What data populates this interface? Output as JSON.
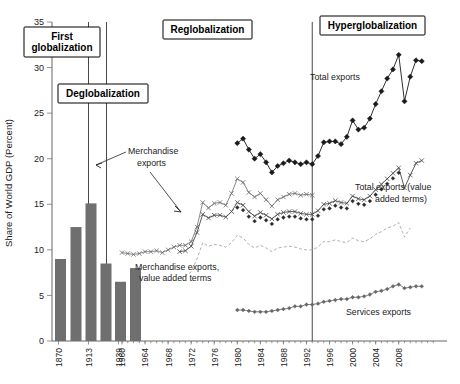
{
  "figure": {
    "y_axis_title": "Share of World GDP (Percent)",
    "y_ticks": [
      0,
      5,
      10,
      15,
      20,
      25,
      30,
      35
    ],
    "y_min": 0,
    "y_max": 35,
    "x_ticks_early": [
      "1870",
      "1913",
      "1939",
      "1960"
    ],
    "x_ticks_modern": [
      "1964",
      "1968",
      "1972",
      "1976",
      "1980",
      "1984",
      "1988",
      "1992",
      "1996",
      "2000",
      "2004",
      "2008"
    ]
  },
  "eras": [
    {
      "label": "First\nglobalization",
      "line1": "First",
      "line2": "globalization"
    },
    {
      "label": "Deglobalization"
    },
    {
      "label": "Reglobalization"
    },
    {
      "label": "Hyperglobalization"
    }
  ],
  "era_labels": {
    "first_line1": "First",
    "first_line2": "globalization",
    "deglobalization": "Deglobalization",
    "reglobalization": "Reglobalization",
    "hyperglobalization": "Hyperglobalization"
  },
  "annotations": {
    "merchandise_exports_line1": "Merchandise",
    "merchandise_exports_line2": "exports",
    "merchandise_va_line1": "Merchandise exports,",
    "merchandise_va_line2": "value added terms",
    "total_exports": "Total exports",
    "total_exports_va_line1": "Total exports (value",
    "total_exports_va_line2": "added terms)",
    "services_exports": "Services exports"
  },
  "colors": {
    "bar": "#6f6f6f",
    "total_exports": "#1a1a1a",
    "total_exports_va": "#4a4a4a",
    "merchandise": "#6a6a6a",
    "merchandise_va": "#b0b0b0",
    "services": "#666666",
    "divider": "#333333",
    "axis": "#555555"
  },
  "chart_data": {
    "type": "line",
    "title": "",
    "xlabel": "",
    "ylabel": "Share of World GDP (Percent)",
    "ylim": [
      0,
      35
    ],
    "grid": false,
    "legend": "annotations-inline",
    "era_dividers_years": [
      1913,
      1939,
      1993
    ],
    "bars": {
      "type": "bar",
      "name": "Merchandise exports (historical benchmarks)",
      "categories": [
        "1870",
        "1890",
        "1913",
        "1929",
        "1939",
        "1950"
      ],
      "values": [
        9.0,
        12.5,
        15.1,
        8.5,
        6.5,
        8.0
      ]
    },
    "series": [
      {
        "name": "Merchandise exports",
        "marker": "x",
        "x": [
          1960,
          1961,
          1962,
          1963,
          1964,
          1965,
          1966,
          1967,
          1968,
          1969,
          1970,
          1971,
          1972,
          1973,
          1974,
          1975,
          1976,
          1977,
          1978,
          1979,
          1980,
          1981,
          1982,
          1983,
          1984,
          1985,
          1986,
          1987,
          1988,
          1989,
          1990,
          1991,
          1992,
          1993
        ],
        "values": [
          9.7,
          9.6,
          9.5,
          9.6,
          9.8,
          9.8,
          9.9,
          9.7,
          10.0,
          10.3,
          10.5,
          10.5,
          10.9,
          12.5,
          15.2,
          14.6,
          15.1,
          15.2,
          14.9,
          16.2,
          17.8,
          17.4,
          16.3,
          15.8,
          16.2,
          15.5,
          14.8,
          15.5,
          15.8,
          16.1,
          16.2,
          16.0,
          16.1,
          16.0
        ]
      },
      {
        "name": "Merchandise exports, value added terms",
        "marker": "dashed",
        "x": [
          1970,
          1971,
          1972,
          1973,
          1974,
          1975,
          1976,
          1977,
          1978,
          1979,
          1980,
          1981,
          1982,
          1983,
          1984,
          1985,
          1986,
          1987,
          1988,
          1989,
          1990,
          1991,
          1992,
          1993,
          1994,
          1995,
          1996,
          1997,
          1998,
          1999,
          2000,
          2001,
          2002,
          2003,
          2004,
          2005,
          2006,
          2007,
          2008,
          2009,
          2010
        ],
        "values": [
          7.0,
          7.1,
          7.6,
          9.0,
          10.8,
          10.4,
          10.6,
          10.5,
          10.3,
          10.8,
          11.6,
          11.3,
          10.6,
          10.2,
          10.5,
          10.2,
          9.8,
          10.2,
          10.3,
          10.4,
          10.3,
          10.1,
          10.0,
          10.0,
          10.3,
          10.9,
          10.9,
          11.1,
          10.9,
          10.8,
          11.3,
          11.0,
          10.9,
          11.2,
          11.7,
          12.0,
          12.4,
          12.6,
          13.0,
          11.4,
          12.4
        ]
      },
      {
        "name": "Total exports",
        "marker": "filled-diamond",
        "x": [
          1980,
          1981,
          1982,
          1983,
          1984,
          1985,
          1986,
          1987,
          1988,
          1989,
          1990,
          1991,
          1992,
          1993,
          1994,
          1995,
          1996,
          1997,
          1998,
          1999,
          2000,
          2001,
          2002,
          2003,
          2004,
          2005,
          2006,
          2007,
          2008,
          2009,
          2010,
          2011,
          2012
        ],
        "values": [
          21.7,
          22.2,
          21.0,
          20.0,
          20.5,
          19.6,
          18.5,
          19.2,
          19.5,
          19.8,
          19.6,
          19.4,
          19.6,
          19.4,
          20.3,
          21.8,
          21.9,
          21.9,
          21.6,
          22.4,
          24.2,
          23.2,
          23.4,
          24.4,
          26.0,
          27.4,
          28.8,
          29.8,
          31.4,
          26.3,
          29.0,
          30.8,
          30.7
        ]
      },
      {
        "name": "Total exports (value added terms)",
        "marker": "open-x",
        "x": [
          1970,
          1971,
          1972,
          1973,
          1974,
          1975,
          1976,
          1977,
          1978,
          1979,
          1980,
          1981,
          1982,
          1983,
          1984,
          1985,
          1986,
          1987,
          1988,
          1989,
          1990,
          1991,
          1992,
          1993,
          1994,
          1995,
          1996,
          1997,
          1998,
          1999,
          2000,
          2001,
          2002,
          2003,
          2004,
          2005,
          2006,
          2007,
          2008,
          2009,
          2010,
          2011,
          2012
        ],
        "values": [
          9.8,
          9.9,
          10.4,
          11.9,
          13.9,
          13.5,
          13.8,
          13.8,
          13.6,
          14.2,
          15.2,
          14.9,
          14.2,
          13.7,
          14.1,
          13.8,
          13.4,
          13.9,
          14.1,
          14.2,
          14.2,
          14.0,
          13.9,
          13.9,
          14.3,
          15.0,
          15.1,
          15.4,
          15.2,
          15.1,
          15.9,
          15.6,
          15.5,
          15.9,
          16.6,
          17.2,
          17.8,
          18.4,
          19.0,
          16.8,
          18.2,
          19.5,
          19.8
        ]
      },
      {
        "name": "Services exports",
        "marker": "small-filled",
        "x": [
          1980,
          1981,
          1982,
          1983,
          1984,
          1985,
          1986,
          1987,
          1988,
          1989,
          1990,
          1991,
          1992,
          1993,
          1994,
          1995,
          1996,
          1997,
          1998,
          1999,
          2000,
          2001,
          2002,
          2003,
          2004,
          2005,
          2006,
          2007,
          2008,
          2009,
          2010,
          2011,
          2012
        ],
        "values": [
          3.4,
          3.4,
          3.3,
          3.2,
          3.2,
          3.2,
          3.3,
          3.4,
          3.5,
          3.6,
          3.8,
          3.8,
          4.0,
          4.0,
          4.1,
          4.3,
          4.4,
          4.5,
          4.6,
          4.6,
          4.8,
          4.8,
          4.9,
          5.1,
          5.4,
          5.5,
          5.7,
          6.0,
          6.2,
          5.8,
          5.9,
          6.0,
          6.0
        ]
      }
    ]
  }
}
